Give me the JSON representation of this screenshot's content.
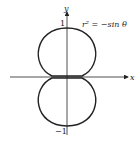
{
  "figure": {
    "equation": "r² = −sin θ",
    "x_axis_label": "x",
    "y_axis_label": "y",
    "tick_top": "1",
    "tick_bottom": "−1"
  }
}
